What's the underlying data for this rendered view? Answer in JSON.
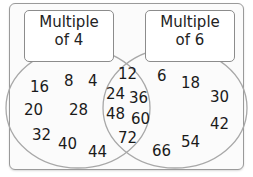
{
  "sets": {
    "left": {
      "label_line1": "Multiple",
      "label_line2": "of 4",
      "only": [
        "16",
        "8",
        "4",
        "20",
        "28",
        "32",
        "40",
        "44"
      ]
    },
    "right": {
      "label_line1": "Multiple",
      "label_line2": "of 6",
      "only": [
        "6",
        "18",
        "30",
        "42",
        "54",
        "66"
      ]
    },
    "intersection": [
      "12",
      "24",
      "36",
      "48",
      "60",
      "72"
    ]
  },
  "colors": {
    "circle_stroke": "#a8a8a8",
    "frame_stroke": "#9a9a9a",
    "text": "#1a1a1a"
  }
}
